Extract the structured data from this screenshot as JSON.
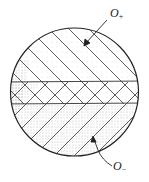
{
  "diagram": {
    "labels": {
      "top": {
        "main": "O",
        "sub": "+"
      },
      "bottom": {
        "main": "O",
        "sub": "−"
      }
    },
    "colors": {
      "stroke": "#222222",
      "stipple": "#555555",
      "background": "#ffffff"
    }
  }
}
